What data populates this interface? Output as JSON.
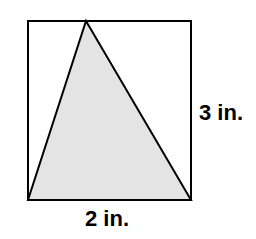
{
  "figure": {
    "background_color": "#ffffff",
    "stroke_color": "#000000",
    "stroke_width": 2,
    "rectangle": {
      "name": "bounding-rectangle",
      "fill": "#ffffff",
      "x": 28,
      "y": 21,
      "width": 163,
      "height": 179,
      "points": "28,21 191,21 191,200 28,200"
    },
    "triangle": {
      "name": "shaded-triangle",
      "fill": "#e4e4e4",
      "apex": {
        "x": 86,
        "y": 21
      },
      "bottom_left": {
        "x": 28,
        "y": 200
      },
      "bottom_right": {
        "x": 191,
        "y": 200
      },
      "points": "86,21 191,200 28,200"
    }
  },
  "labels": {
    "height": {
      "text": "3 in.",
      "value": 3,
      "unit": "in.",
      "position": "right"
    },
    "width": {
      "text": "2 in.",
      "value": 2,
      "unit": "in.",
      "position": "bottom"
    }
  }
}
